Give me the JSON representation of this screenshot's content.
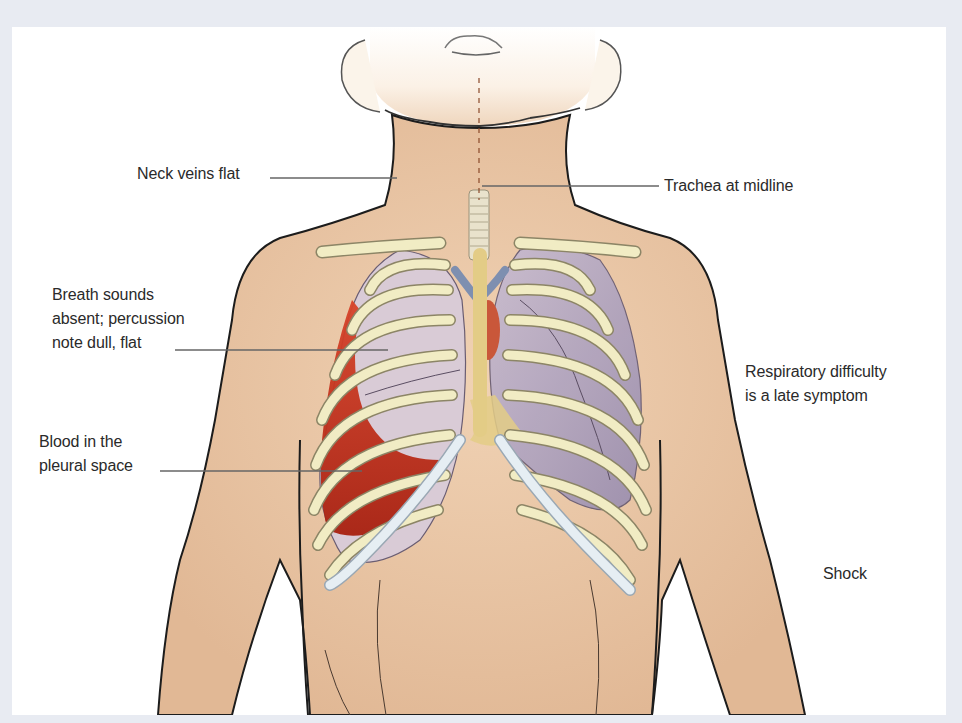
{
  "figure": {
    "colors": {
      "background_frame": "#e8ebf2",
      "panel": "#ffffff",
      "skin": "#ecc9a8",
      "skin_shadow": "#d9b08d",
      "outline": "#1c1c1c",
      "bone": "#f1ecc4",
      "rib_lower": "#e6eef3",
      "lung_left_image_right": "#cfc2d2",
      "lung_collapsed": "#a89cb6",
      "blood": "#c8301a",
      "vessel": "#7e8fb0",
      "leader_line": "#666666",
      "label_text": "#2a2a2a"
    }
  },
  "labels": [
    {
      "id": "neck-veins",
      "lines": [
        "Neck veins flat"
      ]
    },
    {
      "id": "trachea",
      "lines": [
        "Trachea at midline"
      ]
    },
    {
      "id": "breath-sounds",
      "lines": [
        "Breath sounds",
        "absent; percussion",
        "note dull, flat"
      ]
    },
    {
      "id": "respiratory",
      "lines": [
        "Respiratory difficulty",
        "is a late symptom"
      ]
    },
    {
      "id": "blood-pleural",
      "lines": [
        "Blood in the",
        "pleural space"
      ]
    },
    {
      "id": "shock",
      "lines": [
        "Shock"
      ]
    }
  ]
}
